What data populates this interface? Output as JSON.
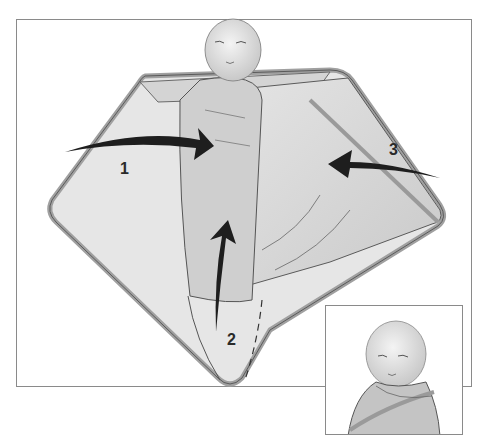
{
  "figure": {
    "steps": [
      {
        "number": "1",
        "description": "Fold left side of blanket across baby"
      },
      {
        "number": "2",
        "description": "Fold bottom of blanket up"
      },
      {
        "number": "3",
        "description": "Fold right side of blanket across baby"
      }
    ],
    "inset": {
      "description": "Swaddled sleeping baby close-up"
    },
    "caption_cropped": " "
  },
  "colors": {
    "blanket_fill": "#d8d8d8",
    "blanket_edge": "#a9a9a9",
    "outline": "#555555",
    "arrow": "#1e1e1e",
    "frame": "#8a8a8a"
  }
}
